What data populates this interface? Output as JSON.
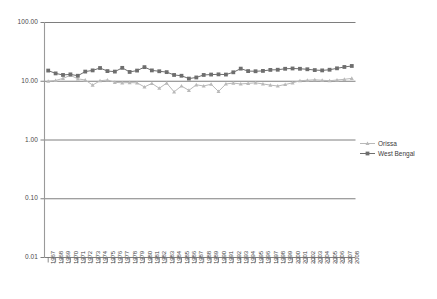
{
  "chart_data": {
    "type": "line",
    "title": "",
    "subtitle": "",
    "xlabel": "",
    "ylabel": "",
    "yscale": "log",
    "ylim": [
      0.01,
      100.0
    ],
    "ytick_labels": [
      "100.00",
      "10.00",
      "1.00",
      "0.10",
      "0.01"
    ],
    "ytick_values": [
      100.0,
      10.0,
      1.0,
      0.1,
      0.01
    ],
    "grid": true,
    "legend_position": "right",
    "categories": [
      "1967",
      "1968",
      "1969",
      "1970",
      "1971",
      "1972",
      "1973",
      "1974",
      "1975",
      "1976",
      "1977",
      "1978",
      "1979",
      "1980",
      "1981",
      "1982",
      "1983",
      "1984",
      "1985",
      "1986",
      "1987",
      "1988",
      "1989",
      "1990",
      "1991",
      "1992",
      "1993",
      "1994",
      "1995",
      "1996",
      "1997",
      "1998",
      "1999",
      "2000",
      "2001",
      "2002",
      "2003",
      "2004",
      "2005",
      "2006",
      "2007",
      "2008"
    ],
    "series": [
      {
        "name": "Orissa",
        "color": "#b9b9b9",
        "marker": "triangle",
        "values": [
          10.0,
          10.3,
          11.2,
          12.6,
          11.0,
          10.5,
          8.6,
          10.2,
          10.5,
          9.6,
          9.4,
          9.5,
          9.4,
          8.0,
          9.2,
          7.6,
          9.3,
          6.6,
          8.3,
          7.0,
          8.7,
          8.3,
          8.9,
          6.7,
          9.0,
          9.3,
          9.0,
          9.2,
          9.4,
          9.0,
          8.6,
          8.3,
          8.8,
          9.4,
          10.2,
          10.4,
          10.6,
          10.4,
          10.2,
          10.5,
          10.8,
          11.2
        ]
      },
      {
        "name": "West Bengal",
        "color": "#6e6e6e",
        "marker": "square",
        "values": [
          15.2,
          13.6,
          12.8,
          13.1,
          12.4,
          14.6,
          15.3,
          16.8,
          14.9,
          14.6,
          16.9,
          14.4,
          15.2,
          17.4,
          15.3,
          14.8,
          14.3,
          12.8,
          12.4,
          11.1,
          11.6,
          12.8,
          13.0,
          13.1,
          13.0,
          14.2,
          16.4,
          14.9,
          14.8,
          15.0,
          15.6,
          15.7,
          16.3,
          16.5,
          16.3,
          16.0,
          15.5,
          15.3,
          15.7,
          16.6,
          17.5,
          18.2
        ]
      }
    ]
  },
  "legend": {
    "items": [
      {
        "label": "Orissa"
      },
      {
        "label": "West Bengal"
      }
    ]
  },
  "colors": {
    "orissa": "#b9b9b9",
    "west_bengal": "#6e6e6e",
    "axis": "#8a8a8a",
    "grid": "#6f6f6f",
    "text": "#3a3a3a"
  }
}
